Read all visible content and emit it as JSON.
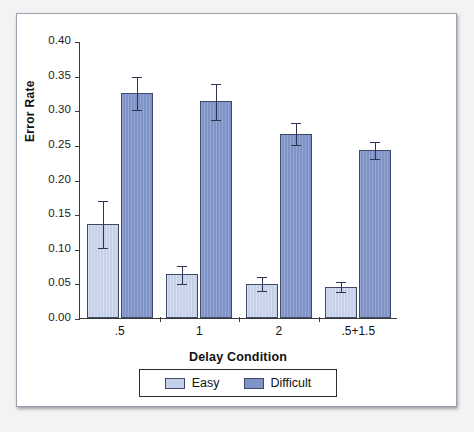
{
  "chart_data": {
    "type": "bar",
    "title": "",
    "xlabel": "Delay Condition",
    "ylabel": "Error Rate",
    "categories": [
      ".5",
      "1",
      "2",
      ".5+1.5"
    ],
    "ylim": [
      0.0,
      0.4
    ],
    "ytick_labels": [
      "0.00",
      "0.05",
      "0.10",
      "0.15",
      "0.20",
      "0.25",
      "0.30",
      "0.35",
      "0.40"
    ],
    "ytick_values": [
      0.0,
      0.05,
      0.1,
      0.15,
      0.2,
      0.25,
      0.3,
      0.35,
      0.4
    ],
    "grid": false,
    "legend_position": "bottom",
    "series": [
      {
        "name": "Easy",
        "color": "#c3d0e8",
        "values": [
          0.136,
          0.063,
          0.049,
          0.045
        ],
        "errors_low": [
          0.103,
          0.051,
          0.04,
          0.039
        ],
        "errors_high": [
          0.171,
          0.077,
          0.06,
          0.053
        ]
      },
      {
        "name": "Difficult",
        "color": "#7f93c6",
        "values": [
          0.325,
          0.313,
          0.266,
          0.242
        ],
        "errors_low": [
          0.302,
          0.288,
          0.251,
          0.231
        ],
        "errors_high": [
          0.35,
          0.339,
          0.283,
          0.255
        ]
      }
    ]
  },
  "legend": {
    "items": [
      {
        "label": "Easy",
        "swatch": "easy-swatch"
      },
      {
        "label": "Difficult",
        "swatch": "difficult-swatch"
      }
    ]
  }
}
